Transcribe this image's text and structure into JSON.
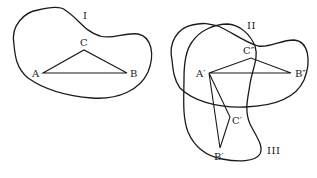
{
  "figure": {
    "left_panel": {
      "region_label": "I",
      "points": {
        "A": {
          "label": "A",
          "x": 43,
          "y": 73
        },
        "B": {
          "label": "B",
          "x": 127,
          "y": 73
        },
        "C": {
          "label": "C",
          "x": 84,
          "y": 50
        }
      }
    },
    "right_panel": {
      "region_labels": {
        "II": "II",
        "III": "III"
      },
      "points": {
        "A_prime": {
          "label": "A′",
          "x": 209,
          "y": 73
        },
        "B_double_prime": {
          "label": "B″",
          "x": 291,
          "y": 73
        },
        "C_double_prime": {
          "label": "C″",
          "x": 252,
          "y": 54
        },
        "C_prime": {
          "label": "C′",
          "x": 230,
          "y": 118
        },
        "B_prime": {
          "label": "B′",
          "x": 220,
          "y": 148
        }
      }
    }
  }
}
